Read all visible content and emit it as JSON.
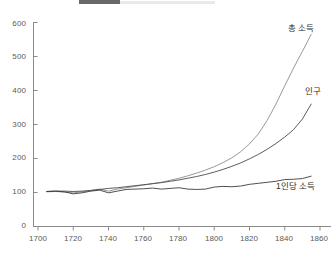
{
  "chart_data": {
    "type": "line",
    "title": "",
    "xlabel": "",
    "ylabel": "",
    "xlim": [
      1700,
      1860
    ],
    "ylim": [
      0,
      600
    ],
    "grid": false,
    "legend_position": "inline-at-line-end",
    "yticks": [
      0,
      100,
      200,
      300,
      400,
      500,
      600
    ],
    "xticks": [
      1700,
      1720,
      1740,
      1760,
      1780,
      1800,
      1820,
      1840,
      1860
    ],
    "x": [
      1705,
      1710,
      1715,
      1720,
      1725,
      1730,
      1735,
      1740,
      1745,
      1750,
      1755,
      1760,
      1765,
      1770,
      1775,
      1780,
      1785,
      1790,
      1795,
      1800,
      1805,
      1810,
      1815,
      1820,
      1825,
      1830,
      1835,
      1840,
      1845,
      1850,
      1855
    ],
    "series": [
      {
        "name": "총 소득",
        "color": "#8c8c8c",
        "label_value": 565,
        "values": [
          102,
          103,
          101,
          99,
          102,
          106,
          110,
          104,
          110,
          114,
          118,
          122,
          126,
          130,
          136,
          142,
          149,
          157,
          166,
          176,
          188,
          202,
          220,
          243,
          272,
          312,
          360,
          414,
          466,
          515,
          565
        ]
      },
      {
        "name": "인구",
        "color": "#4a4a4a",
        "label_value": 360,
        "values": [
          103,
          104,
          104,
          103,
          104,
          106,
          109,
          112,
          114,
          117,
          120,
          123,
          126,
          129,
          133,
          137,
          142,
          147,
          153,
          160,
          168,
          177,
          187,
          199,
          212,
          227,
          244,
          263,
          285,
          316,
          360
        ]
      },
      {
        "name": "1인당 소득",
        "color": "#3c3c3c",
        "label_value": 148,
        "values": [
          103,
          104,
          102,
          96,
          99,
          104,
          107,
          99,
          104,
          109,
          110,
          111,
          113,
          110,
          112,
          114,
          110,
          109,
          110,
          116,
          118,
          117,
          119,
          124,
          127,
          130,
          133,
          138,
          139,
          141,
          148
        ]
      }
    ]
  },
  "labels": {
    "total_income": "총 소득",
    "population": "인구",
    "per_capita_income": "1인당 소득"
  },
  "yticks": {
    "t0": "0",
    "t1": "100",
    "t2": "200",
    "t3": "300",
    "t4": "400",
    "t5": "500",
    "t6": "600"
  },
  "xticks": {
    "t0": "1700",
    "t1": "1720",
    "t2": "1740",
    "t3": "1760",
    "t4": "1780",
    "t5": "1800",
    "t6": "1820",
    "t7": "1840",
    "t8": "1860"
  }
}
